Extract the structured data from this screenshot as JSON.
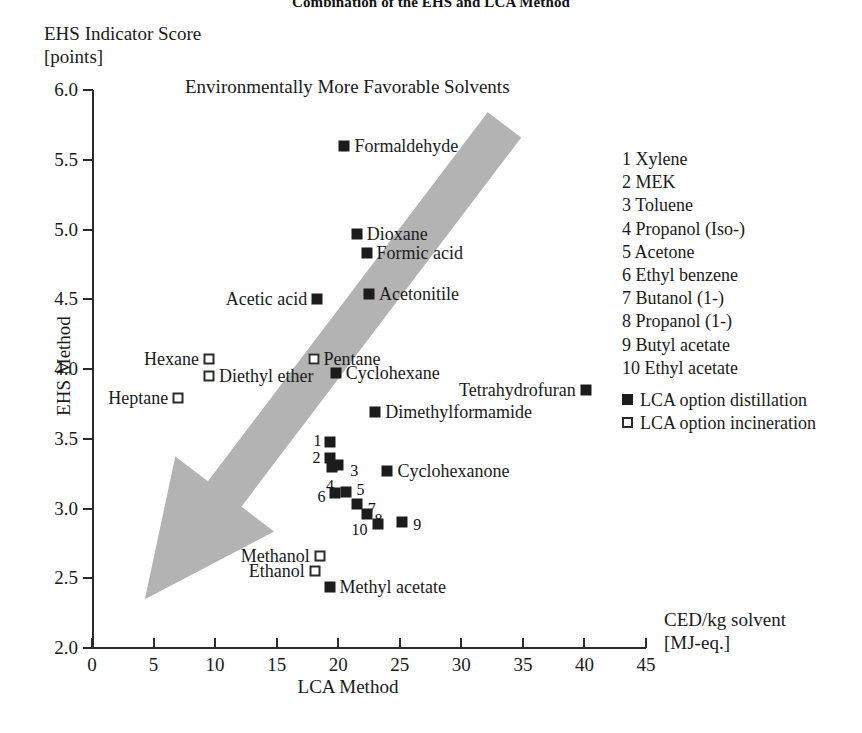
{
  "title": "Combination of the EHS and LCA Method",
  "banner_text": "Environmentally More Favorable Solvents",
  "axes": {
    "y_title_line1": "EHS Indicator Score",
    "y_title_line2": "[points]",
    "y_axis_label": "EHS Method",
    "x_axis_label": "LCA Method",
    "x_unit_line1": "CED/kg solvent",
    "x_unit_line2": "[MJ-eq.]",
    "x_ticks": [
      "0",
      "5",
      "10",
      "15",
      "20",
      "25",
      "30",
      "35",
      "40",
      "45"
    ],
    "y_ticks": [
      "2.0",
      "2.5",
      "3.0",
      "3.5",
      "4.0",
      "4.5",
      "5.0",
      "5.5",
      "6.0"
    ],
    "xlim": [
      0,
      45
    ],
    "ylim": [
      2.0,
      6.0
    ]
  },
  "legend": {
    "numbered": [
      "1 Xylene",
      "2 MEK",
      "3 Toluene",
      "4 Propanol (Iso-)",
      "5 Acetone",
      "6 Ethyl benzene",
      "7 Butanol (1-)",
      "8 Propanol (1-)",
      "9 Butyl acetate",
      "10 Ethyl acetate"
    ],
    "symbols": [
      {
        "marker": "filled",
        "label": "LCA option distillation"
      },
      {
        "marker": "open",
        "label": "LCA option incineration"
      }
    ]
  },
  "colors": {
    "marker_fill": "#1c1c1c",
    "marker_edge": "#2a2a2a",
    "arrow": "#b3b3b3",
    "axis": "#2b2b2b",
    "text": "#1a1a1a",
    "background": "#ffffff"
  },
  "chart_data": {
    "type": "scatter",
    "title": "Combination of the EHS and LCA Method",
    "xlabel": "LCA Method",
    "ylabel": "EHS Method",
    "xunit": "CED/kg solvent [MJ-eq.]",
    "yunit": "EHS Indicator Score [points]",
    "xlim": [
      0,
      45
    ],
    "ylim": [
      2.0,
      6.0
    ],
    "grid": false,
    "legend_position": "right",
    "annotation": "Environmentally More Favorable Solvents",
    "series": [
      {
        "name": "LCA option distillation",
        "marker": "filled"
      },
      {
        "name": "LCA option incineration",
        "marker": "open"
      }
    ],
    "points": [
      {
        "name": "Formaldehyde",
        "x": 20.5,
        "y": 5.6,
        "marker": "filled",
        "label_side": "right",
        "num": null
      },
      {
        "name": "Dioxane",
        "x": 21.5,
        "y": 4.97,
        "marker": "filled",
        "label_side": "right",
        "num": null
      },
      {
        "name": "Formic acid",
        "x": 22.3,
        "y": 4.83,
        "marker": "filled",
        "label_side": "right",
        "num": null
      },
      {
        "name": "Acetic acid",
        "x": 18.3,
        "y": 4.5,
        "marker": "filled",
        "label_side": "left",
        "num": null
      },
      {
        "name": "Acetonitile",
        "x": 22.5,
        "y": 4.54,
        "marker": "filled",
        "label_side": "right",
        "num": null
      },
      {
        "name": "Hexane",
        "x": 9.5,
        "y": 4.07,
        "marker": "open",
        "label_side": "left",
        "num": null
      },
      {
        "name": "Pentane",
        "x": 18.0,
        "y": 4.07,
        "marker": "open",
        "label_side": "right",
        "num": null
      },
      {
        "name": "Diethyl ether",
        "x": 9.5,
        "y": 3.95,
        "marker": "open",
        "label_side": "right",
        "num": null
      },
      {
        "name": "Cyclohexane",
        "x": 19.8,
        "y": 3.97,
        "marker": "filled",
        "label_side": "right",
        "num": null
      },
      {
        "name": "Heptane",
        "x": 7.0,
        "y": 3.79,
        "marker": "open",
        "label_side": "left",
        "num": null
      },
      {
        "name": "Tetrahydrofuran",
        "x": 40.1,
        "y": 3.85,
        "marker": "filled",
        "label_side": "left",
        "num": null
      },
      {
        "name": "Dimethylformamide",
        "x": 23.0,
        "y": 3.69,
        "marker": "filled",
        "label_side": "right",
        "num": null
      },
      {
        "name": "Xylene",
        "x": 19.3,
        "y": 3.48,
        "marker": "filled",
        "label_side": "none",
        "num": "1",
        "num_dx": -16,
        "num_dy": -1
      },
      {
        "name": "MEK",
        "x": 19.3,
        "y": 3.36,
        "marker": "filled",
        "label_side": "none",
        "num": "2",
        "num_dx": -17,
        "num_dy": 0
      },
      {
        "name": "Toluene",
        "x": 20.0,
        "y": 3.31,
        "marker": "filled",
        "label_side": "none",
        "num": "3",
        "num_dx": 12,
        "num_dy": 6
      },
      {
        "name": "Propanol (Iso-)",
        "x": 19.5,
        "y": 3.3,
        "marker": "filled",
        "label_side": "none",
        "num": "4",
        "num_dx": -6,
        "num_dy": 19
      },
      {
        "name": "Acetone",
        "x": 20.6,
        "y": 3.12,
        "marker": "filled",
        "label_side": "none",
        "num": "5",
        "num_dx": 11,
        "num_dy": -2
      },
      {
        "name": "Ethyl benzene",
        "x": 19.7,
        "y": 3.11,
        "marker": "filled",
        "label_side": "none",
        "num": "6",
        "num_dx": -17,
        "num_dy": 4
      },
      {
        "name": "Butanol (1-)",
        "x": 21.5,
        "y": 3.03,
        "marker": "filled",
        "label_side": "none",
        "num": "7",
        "num_dx": 11,
        "num_dy": 5
      },
      {
        "name": "Propanol (1-)",
        "x": 22.3,
        "y": 2.96,
        "marker": "filled",
        "label_side": "none",
        "num": "8",
        "num_dx": 8,
        "num_dy": 6
      },
      {
        "name": "Butyl acetate",
        "x": 25.2,
        "y": 2.9,
        "marker": "filled",
        "label_side": "none",
        "num": "9",
        "num_dx": 11,
        "num_dy": 3
      },
      {
        "name": "Ethyl acetate",
        "x": 23.2,
        "y": 2.89,
        "marker": "filled",
        "label_side": "none",
        "num": "10",
        "num_dx": -26,
        "num_dy": 6
      },
      {
        "name": "Cyclohexanone",
        "x": 24.0,
        "y": 3.27,
        "marker": "filled",
        "label_side": "right",
        "num": null
      },
      {
        "name": "Methanol",
        "x": 18.5,
        "y": 2.66,
        "marker": "open",
        "label_side": "left",
        "num": null
      },
      {
        "name": "Ethanol",
        "x": 18.1,
        "y": 2.55,
        "marker": "open",
        "label_side": "left",
        "num": null
      },
      {
        "name": "Methyl acetate",
        "x": 19.3,
        "y": 2.44,
        "marker": "filled",
        "label_side": "right",
        "num": null
      }
    ],
    "arrow": {
      "description": "Broad grey arrow pointing down-left toward environmentally more favorable solvents",
      "from": [
        33.5,
        5.75
      ],
      "to": [
        4.3,
        2.35
      ]
    }
  }
}
